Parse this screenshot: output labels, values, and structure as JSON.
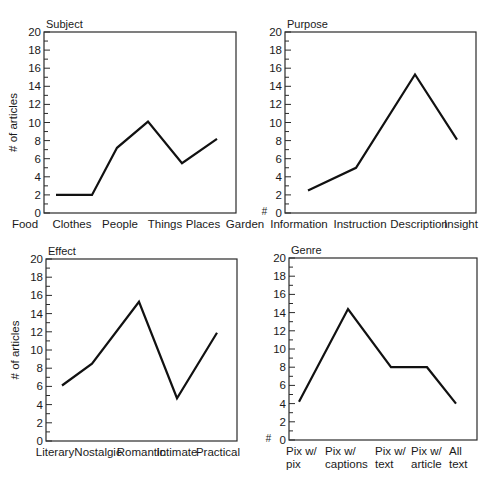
{
  "chart_data": [
    {
      "type": "line",
      "title": "Subject",
      "xlabel": "",
      "ylabel": "# of articles",
      "ylim": [
        0,
        20
      ],
      "yticks": [
        0,
        2,
        4,
        6,
        8,
        10,
        12,
        14,
        16,
        18,
        20
      ],
      "grid": false,
      "categories": [
        "Food",
        "Clothes",
        "People",
        "Things",
        "Places",
        "Garden"
      ],
      "category_lines": [
        [
          "Food"
        ],
        [
          "Clothes"
        ],
        [
          "People"
        ],
        [
          "Things"
        ],
        [
          "Places"
        ],
        [
          "Garden"
        ]
      ],
      "values": [
        2,
        2,
        7.2,
        10.1,
        5.5,
        8.2
      ],
      "box": {
        "x": 44,
        "y": 32,
        "w": 192,
        "h": 181
      },
      "point_x": [
        56,
        92,
        117,
        148,
        182,
        217
      ],
      "label_x": [
        25,
        72,
        120,
        165,
        203,
        245
      ],
      "show_hash_at_zero": false
    },
    {
      "type": "line",
      "title": "Purpose",
      "xlabel": "",
      "ylabel": "#",
      "ylim": [
        0,
        20
      ],
      "yticks": [
        0,
        2,
        4,
        6,
        8,
        10,
        12,
        14,
        16,
        18,
        20
      ],
      "grid": false,
      "categories": [
        "Information",
        "Instruction",
        "Description",
        "Insight"
      ],
      "category_lines": [
        [
          "Information"
        ],
        [
          "Instruction"
        ],
        [
          "Description"
        ],
        [
          "Insight"
        ]
      ],
      "values": [
        2.5,
        5.0,
        15.3,
        8.1
      ],
      "box": {
        "x": 285,
        "y": 32,
        "w": 191,
        "h": 181
      },
      "point_x": [
        308,
        356,
        415,
        457
      ],
      "label_x": [
        299,
        360,
        419,
        461
      ],
      "show_hash_at_zero": true
    },
    {
      "type": "line",
      "title": "Effect",
      "xlabel": "",
      "ylabel": "# of articles",
      "ylim": [
        0,
        20
      ],
      "yticks": [
        0,
        2,
        4,
        6,
        8,
        10,
        12,
        14,
        16,
        18,
        20
      ],
      "grid": false,
      "categories": [
        "Literary",
        "Nostalgic",
        "Romantic",
        "Intimate",
        "Practical"
      ],
      "category_lines": [
        [
          "Literary"
        ],
        [
          "Nostalgic"
        ],
        [
          "Romantic"
        ],
        [
          "Intimate"
        ],
        [
          "Practical"
        ]
      ],
      "values": [
        6.1,
        8.5,
        15.3,
        4.7,
        11.9
      ],
      "box": {
        "x": 46,
        "y": 259,
        "w": 191,
        "h": 182
      },
      "point_x": [
        62,
        92,
        139,
        177,
        217
      ],
      "label_x": [
        55,
        98,
        141,
        177,
        218
      ],
      "show_hash_at_zero": false
    },
    {
      "type": "line",
      "title": "Genre",
      "xlabel": "",
      "ylabel": "#",
      "ylim": [
        0,
        20
      ],
      "yticks": [
        0,
        2,
        4,
        6,
        8,
        10,
        12,
        14,
        16,
        18,
        20
      ],
      "grid": false,
      "categories": [
        "Pix w/ pix",
        "Pix w/ captions",
        "Pix w/ text",
        "Pix w/ article",
        "All text"
      ],
      "category_lines": [
        [
          "Pix w/",
          "pix"
        ],
        [
          "Pix w/",
          "captions"
        ],
        [
          "Pix w/",
          "text"
        ],
        [
          "Pix w/",
          "article"
        ],
        [
          "All",
          "text"
        ]
      ],
      "values": [
        4.2,
        14.4,
        8.0,
        8.0,
        4.0
      ],
      "box": {
        "x": 289,
        "y": 258,
        "w": 188,
        "h": 182
      },
      "point_x": [
        299,
        348,
        391,
        427,
        456
      ],
      "label_x": [
        286,
        325,
        375,
        411,
        449
      ],
      "label_anchor": "start",
      "show_hash_at_zero": true
    }
  ]
}
